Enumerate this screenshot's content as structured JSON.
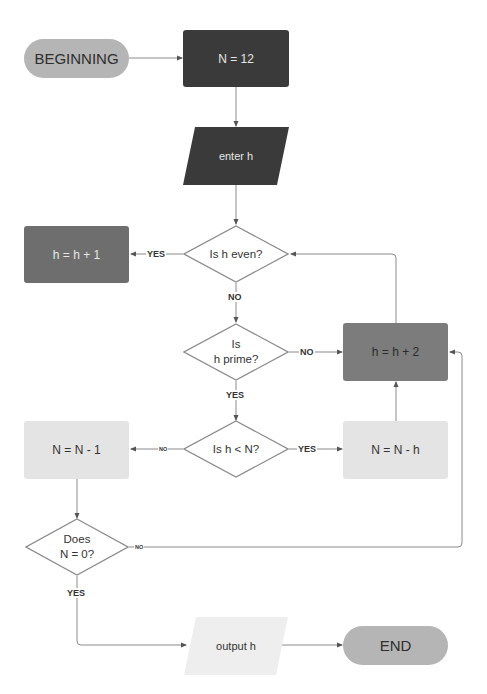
{
  "diagram": {
    "type": "flowchart",
    "nodes": {
      "beginning": {
        "label": "BEGINNING",
        "shape": "terminal"
      },
      "n_init": {
        "label": "N = 12",
        "shape": "process"
      },
      "enter_h": {
        "label": "enter h",
        "shape": "input"
      },
      "is_even": {
        "label": "Is h even?",
        "shape": "decision"
      },
      "h_plus_1": {
        "label": "h = h + 1",
        "shape": "process"
      },
      "is_prime": {
        "label": "Is\nh prime?",
        "shape": "decision"
      },
      "h_plus_2": {
        "label": "h = h + 2",
        "shape": "process"
      },
      "h_less_n": {
        "label": "Is h < N?",
        "shape": "decision"
      },
      "n_minus_h": {
        "label": "N = N - h",
        "shape": "process"
      },
      "n_minus_1": {
        "label": "N = N - 1",
        "shape": "process"
      },
      "n_zero": {
        "label": "Does\nN = 0?",
        "shape": "decision"
      },
      "output_h": {
        "label": "output h",
        "shape": "output"
      },
      "end": {
        "label": "END",
        "shape": "terminal"
      }
    },
    "edge_labels": {
      "even_yes": "YES",
      "even_no": "NO",
      "prime_no": "NO",
      "prime_yes": "YES",
      "less_no": "NO",
      "less_yes": "YES",
      "zero_no": "NO",
      "zero_yes": "YES"
    },
    "edges": [
      {
        "from": "beginning",
        "to": "n_init"
      },
      {
        "from": "n_init",
        "to": "enter_h"
      },
      {
        "from": "enter_h",
        "to": "is_even"
      },
      {
        "from": "is_even",
        "to": "h_plus_1",
        "label": "YES"
      },
      {
        "from": "is_even",
        "to": "is_prime",
        "label": "NO"
      },
      {
        "from": "is_prime",
        "to": "h_plus_2",
        "label": "NO"
      },
      {
        "from": "h_plus_2",
        "to": "is_even"
      },
      {
        "from": "is_prime",
        "to": "h_less_n",
        "label": "YES"
      },
      {
        "from": "h_less_n",
        "to": "n_minus_h",
        "label": "YES"
      },
      {
        "from": "h_less_n",
        "to": "n_minus_1",
        "label": "NO"
      },
      {
        "from": "n_minus_h",
        "to": "h_plus_2"
      },
      {
        "from": "n_minus_1",
        "to": "n_zero"
      },
      {
        "from": "n_zero",
        "to": "h_plus_2",
        "label": "NO"
      },
      {
        "from": "n_zero",
        "to": "output_h",
        "label": "YES"
      },
      {
        "from": "output_h",
        "to": "end"
      }
    ]
  },
  "colors": {
    "terminal": "#b5b5b5",
    "dark_process": "#3a3a3a",
    "mid_process": "#6e6e6e",
    "light_process": "#e4e4e4",
    "line": "#8a8a8a"
  }
}
